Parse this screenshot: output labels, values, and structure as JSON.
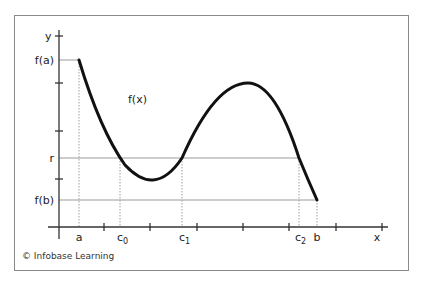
{
  "figure": {
    "credit": "© Infobase Learning",
    "function_label": "f(x)",
    "y_axis_label": "y",
    "x_axis_label": "x",
    "y_labels": {
      "fa": "f(a)",
      "r": "r",
      "fb": "f(b)"
    },
    "x_labels": {
      "a": "a",
      "c0": {
        "base": "c",
        "sub": "0"
      },
      "c1": {
        "base": "c",
        "sub": "1"
      },
      "c2": {
        "base": "c",
        "sub": "2"
      },
      "b": "b"
    },
    "colors": {
      "curve": "#111111",
      "axis": "#333333",
      "guide": "#9a9a9a",
      "frame": "#8a8a8a"
    }
  }
}
